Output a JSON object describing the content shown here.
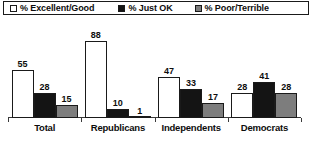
{
  "legend": {
    "entries": [
      {
        "label": "% Excellent/Good",
        "swatch": "legend-swatch-excellent-good",
        "color": "#ffffff"
      },
      {
        "label": "% Just OK",
        "swatch": "legend-swatch-just-ok",
        "color": "#141414"
      },
      {
        "label": "% Poor/Terrible",
        "swatch": "legend-swatch-poor-terrible",
        "color": "#7d7d7d"
      }
    ]
  },
  "chart_data": {
    "type": "bar",
    "title": "",
    "xlabel": "",
    "ylabel": "",
    "ylim": [
      0,
      100
    ],
    "grid": false,
    "legend_position": "top",
    "categories": [
      "Total",
      "Republicans",
      "Independents",
      "Democrats"
    ],
    "series": [
      {
        "name": "% Excellent/Good",
        "color": "#ffffff",
        "values": [
          55,
          88,
          47,
          28
        ]
      },
      {
        "name": "% Just OK",
        "color": "#141414",
        "values": [
          28,
          10,
          33,
          41
        ]
      },
      {
        "name": "% Poor/Terrible",
        "color": "#7d7d7d",
        "values": [
          15,
          1,
          17,
          28
        ]
      }
    ]
  }
}
